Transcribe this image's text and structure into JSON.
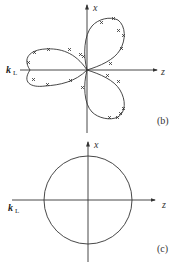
{
  "diagram_b": {
    "x_axis_label": "x",
    "z_axis_label": "z",
    "k_label": "k",
    "k_subscript": "L",
    "caption": "(b)"
  },
  "diagram_c": {
    "x_axis_label": "x",
    "z_axis_label": "z",
    "k_label": "k",
    "k_subscript": "L",
    "caption": "(c)"
  },
  "colors": {
    "line": "#333333",
    "background": "#ffffff"
  }
}
